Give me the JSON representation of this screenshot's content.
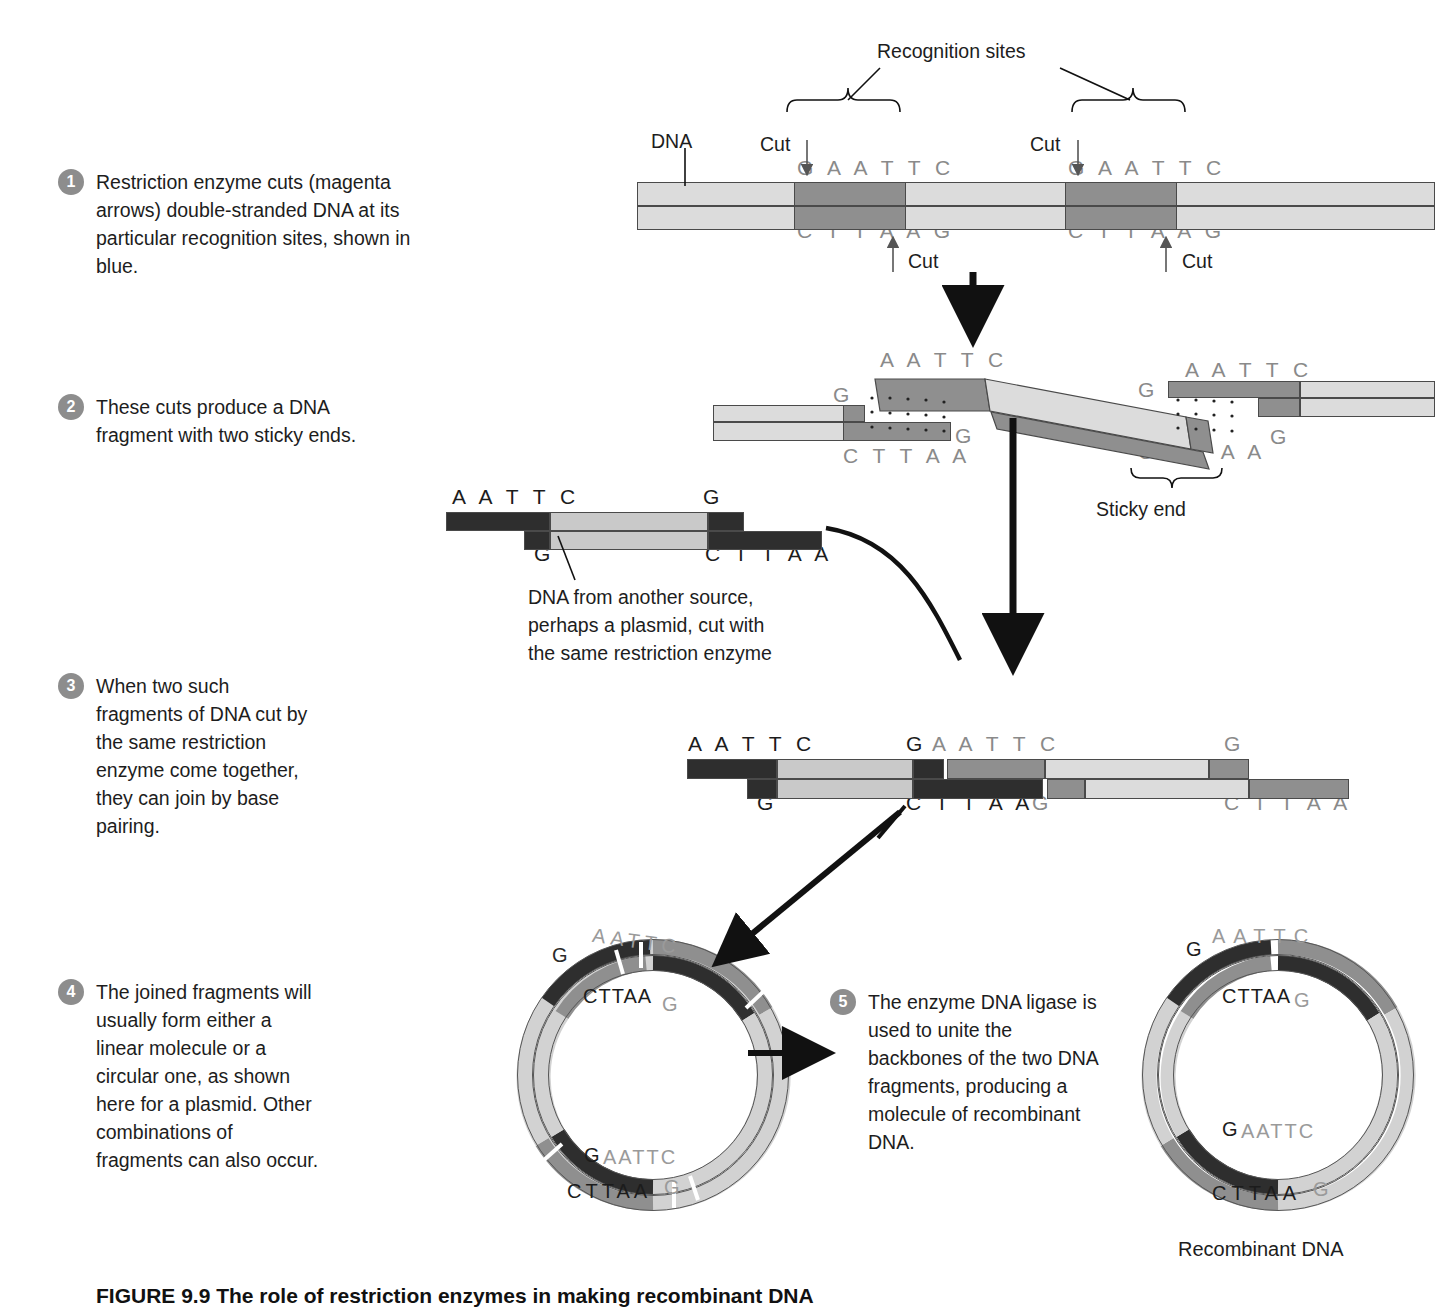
{
  "figure": {
    "caption": "FIGURE 9.9 The role of restriction enzymes in making recombinant DNA"
  },
  "steps": [
    {
      "number": "1",
      "text": "Restriction enzyme cuts (magenta arrows) double-stranded DNA at its particular recognition sites, shown in blue."
    },
    {
      "number": "2",
      "text": "These cuts produce a DNA fragment with two sticky ends."
    },
    {
      "number": "3",
      "text": "When two such fragments of DNA cut by the same restriction enzyme come together, they can join by base pairing."
    },
    {
      "number": "4",
      "text": "The joined fragments will usually form either a linear molecule or a circular one, as shown here for a plasmid. Other combinations of fragments can also occur."
    },
    {
      "number": "5",
      "text": "The enzyme DNA ligase is used to unite the backbones of the two DNA fragments, producing a molecule of recombinant DNA."
    }
  ],
  "labels": {
    "recognition_sites": "Recognition sites",
    "dna": "DNA",
    "cut_top_left": "Cut",
    "cut_top_right": "Cut",
    "cut_bottom_left": "Cut",
    "cut_bottom_right": "Cut",
    "sticky_end": "Sticky end",
    "other_source": "DNA from another source,\nperhaps a plasmid, cut with\nthe same restriction enzyme",
    "other_source_l1": "DNA from another source,",
    "other_source_l2": "perhaps a plasmid, cut with",
    "other_source_l3": "the same restriction enzyme",
    "recombinant_dna": "Recombinant DNA"
  },
  "sequences": {
    "top_strand": "G A A T T C",
    "bottom_strand": "C T T A A G",
    "aattc": "A A T T C",
    "g": "G",
    "cttaa": "C T T A A",
    "aattc_tight": "AATTC",
    "cttaa_tight": "CTTAA",
    "gaattc_tight": "GAATTC",
    "cttaag_tight": "CTTAAG"
  },
  "panel1": {
    "top_left_seq": "G A A T T C",
    "top_right_seq": "G A A T T C",
    "bottom_left_seq": "C T T A A G",
    "bottom_right_seq": "C T T A A G"
  },
  "panel2": {
    "left_frag_bottom": "C T T A A",
    "left_frag_g_top": "G",
    "left_frag_g_bottom": "G",
    "mid_frag_top": "A A T T C",
    "right_frag_top": "A A T T C",
    "right_g_left": "G",
    "right_g_right": "G",
    "right_frag_bottom": "C T T A A"
  },
  "panel_plasmid_fragment": {
    "top_left": "A A T T C",
    "top_right": "G",
    "bottom_left": "G",
    "bottom_right": "C T T A A"
  },
  "panel3": {
    "a_top": "A A T T C",
    "b_top": "G",
    "c_top": "A A T T C",
    "d_top": "G",
    "a_bottom": "G",
    "b_bottom": "C T T A A",
    "c_bottom": "G",
    "d_bottom": "C T T A A"
  },
  "plasmid_left": {
    "top_g": "G",
    "top_aattc": "AATTC",
    "top_cttaa": "CTTAA",
    "top_g2": "G",
    "bottom_g": "G",
    "bottom_aattc": "AATTC",
    "bottom_cttaa": "CTTAA",
    "bottom_g2": "G"
  },
  "plasmid_right": {
    "top_g": "G",
    "top_aattc": "AATTC",
    "top_cttaa": "CTTAA",
    "top_g2": "G",
    "bottom_g": "G",
    "bottom_aattc": "AATTC",
    "bottom_cttaa": "CTTAA",
    "bottom_g2": "G"
  },
  "colors": {
    "backbone_light": "#dcdcdc",
    "recognition_site": "#8f8f8f",
    "foreign_dna": "#2e2e2e",
    "step_badge": "#8d8d8d",
    "text": "#1d1d1d",
    "seq_gray": "#8a8a8a",
    "outline": "#4a4a4a"
  }
}
